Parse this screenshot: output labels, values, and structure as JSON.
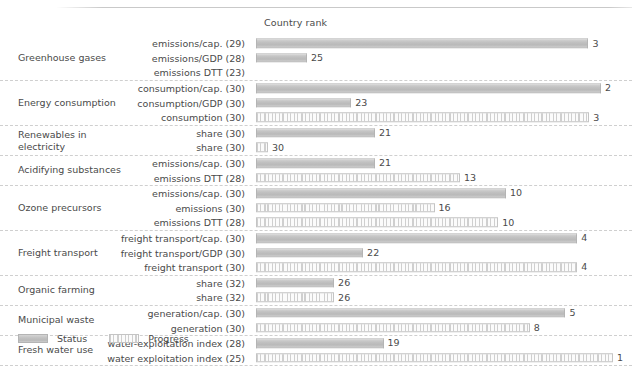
{
  "chart_data": {
    "type": "bar",
    "title": "",
    "xlabel": "Country rank",
    "ylabel": "",
    "orientation": "horizontal",
    "grid": false,
    "legend_position": "bottom-left",
    "note": "Bar length is inverse to rank: shorter bar = worse (higher) rank number. Value labels show the country rank; the number in parentheses after each indicator name is the total number of countries ranked.",
    "legend": [
      {
        "key": "status",
        "label": "Status"
      },
      {
        "key": "progress",
        "label": "Progress"
      }
    ],
    "groups": [
      {
        "label": "Greenhouse gases",
        "rows": [
          {
            "indicator": "emissions/cap.",
            "total": 29,
            "label": "emissions/cap. (29)",
            "rank": 3,
            "series": "status"
          },
          {
            "indicator": "emissions/GDP",
            "total": 28,
            "label": "emissions/GDP (28)",
            "rank": 25,
            "series": "status"
          },
          {
            "indicator": "emissions DTT",
            "total": 23,
            "label": "emissions DTT (23)",
            "rank": null,
            "series": "progress"
          }
        ]
      },
      {
        "label": "Energy consumption",
        "rows": [
          {
            "indicator": "consumption/cap.",
            "total": 30,
            "label": "consumption/cap. (30)",
            "rank": 2,
            "series": "status"
          },
          {
            "indicator": "consumption/GDP",
            "total": 30,
            "label": "consumption/GDP (30)",
            "rank": 23,
            "series": "status"
          },
          {
            "indicator": "consumption",
            "total": 30,
            "label": "consumption (30)",
            "rank": 3,
            "series": "progress"
          }
        ]
      },
      {
        "label": "Renewables in electricity",
        "rows": [
          {
            "indicator": "share",
            "total": 30,
            "label": "share (30)",
            "rank": 21,
            "series": "status"
          },
          {
            "indicator": "share",
            "total": 30,
            "label": "share (30)",
            "rank": 30,
            "series": "progress"
          }
        ]
      },
      {
        "label": "Acidifying substances",
        "rows": [
          {
            "indicator": "emissions/cap.",
            "total": 30,
            "label": "emissions/cap. (30)",
            "rank": 21,
            "series": "status"
          },
          {
            "indicator": "emissions DTT",
            "total": 28,
            "label": "emissions DTT (28)",
            "rank": 13,
            "series": "progress"
          }
        ]
      },
      {
        "label": "Ozone precursors",
        "rows": [
          {
            "indicator": "emissions/cap.",
            "total": 30,
            "label": "emissions/cap. (30)",
            "rank": 10,
            "series": "status"
          },
          {
            "indicator": "emissions",
            "total": 30,
            "label": "emissions (30)",
            "rank": 16,
            "series": "progress"
          },
          {
            "indicator": "emissions DTT",
            "total": 28,
            "label": "emissions DTT (28)",
            "rank": 10,
            "series": "progress"
          }
        ]
      },
      {
        "label": "Freight transport",
        "rows": [
          {
            "indicator": "freight transport/cap.",
            "total": 30,
            "label": "freight transport/cap. (30)",
            "rank": 4,
            "series": "status"
          },
          {
            "indicator": "freight transport/GDP",
            "total": 30,
            "label": "freight transport/GDP (30)",
            "rank": 22,
            "series": "status"
          },
          {
            "indicator": "freight transport",
            "total": 30,
            "label": "freight transport (30)",
            "rank": 4,
            "series": "progress"
          }
        ]
      },
      {
        "label": "Organic farming",
        "rows": [
          {
            "indicator": "share",
            "total": 32,
            "label": "share (32)",
            "rank": 26,
            "series": "status"
          },
          {
            "indicator": "share",
            "total": 32,
            "label": "share (32)",
            "rank": 26,
            "series": "progress"
          }
        ]
      },
      {
        "label": "Municipal waste",
        "rows": [
          {
            "indicator": "generation/cap.",
            "total": 30,
            "label": "generation/cap. (30)",
            "rank": 5,
            "series": "status"
          },
          {
            "indicator": "generation",
            "total": 30,
            "label": "generation (30)",
            "rank": 8,
            "series": "progress"
          }
        ]
      },
      {
        "label": "Fresh water use",
        "rows": [
          {
            "indicator": "water-exploitation index",
            "total": 28,
            "label": "water-exploitation index (28)",
            "rank": 19,
            "series": "status"
          },
          {
            "indicator": "water exploitation index",
            "total": 25,
            "label": "water exploitation index (25)",
            "rank": 1,
            "series": "progress"
          }
        ]
      }
    ],
    "colors": {
      "status_fill": "#c2c2c2",
      "progress_fill": "#fbfbfb",
      "progress_pattern": "#cfcfcf",
      "bar_border": "#b4b4b4",
      "text": "#4a4a4a",
      "separator": "#cfcfcf",
      "background": "#ffffff"
    }
  }
}
